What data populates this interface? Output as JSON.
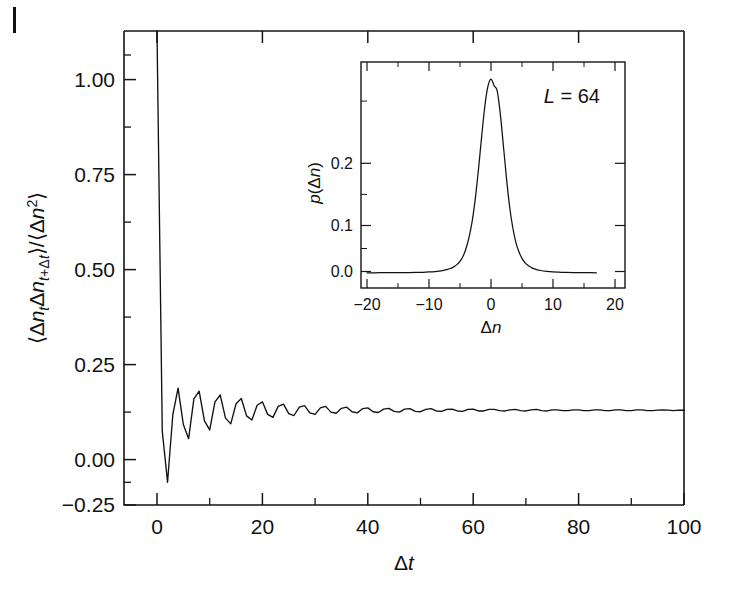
{
  "figure": {
    "page_mark": "|",
    "background_color": "#ffffff",
    "line_color": "#111111"
  },
  "chart_data": [
    {
      "id": "main",
      "type": "line",
      "title": "",
      "xlabel": "Δt",
      "ylabel": "⟨Δn_t Δn_{t+Δt}⟩ / ⟨Δn²⟩",
      "ylabel_parts": {
        "open1": "⟨",
        "delta_n1": "Δn",
        "sub1": "t",
        "delta_n2": "Δn",
        "sub2": "t+Δt",
        "close1": "⟩",
        "slash": "/",
        "open2": "⟨",
        "delta_n3": "Δn",
        "sup": "2",
        "close2": "⟩"
      },
      "xlim": [
        0,
        100
      ],
      "ylim": [
        -0.25,
        1.0
      ],
      "xticks": [
        0,
        20,
        40,
        60,
        80,
        100
      ],
      "xticklabels": [
        "0",
        "20",
        "40",
        "60",
        "80",
        "100"
      ],
      "yticks": [
        -0.25,
        0.0,
        0.25,
        0.5,
        0.75,
        1.0
      ],
      "yticklabels": [
        "−0.25",
        "0.00",
        "0.25",
        "0.50",
        "0.75",
        "1.00"
      ],
      "x_minor_ticks": [
        10,
        30,
        50,
        70,
        90
      ],
      "y_minor_ticks": [
        -0.125,
        0.125,
        0.375,
        0.625,
        0.875
      ],
      "grid": false,
      "legend": null,
      "description": "Normalized autocorrelation of particle-number fluctuations: damped oscillation decaying to zero.",
      "x": [
        0,
        1,
        2,
        3,
        4,
        5,
        6,
        7,
        8,
        9,
        10,
        11,
        12,
        13,
        14,
        15,
        16,
        17,
        18,
        19,
        20,
        21,
        22,
        23,
        24,
        25,
        26,
        27,
        28,
        29,
        30,
        31,
        32,
        33,
        34,
        35,
        36,
        37,
        38,
        39,
        40,
        41,
        42,
        43,
        44,
        45,
        46,
        47,
        48,
        49,
        50,
        51,
        52,
        53,
        54,
        55,
        56,
        57,
        58,
        59,
        60,
        61,
        62,
        63,
        64,
        65,
        66,
        67,
        68,
        69,
        70,
        71,
        72,
        73,
        74,
        75,
        76,
        77,
        78,
        79,
        80,
        81,
        82,
        83,
        84,
        85,
        86,
        87,
        88,
        89,
        90,
        91,
        92,
        93,
        94,
        95,
        96,
        97,
        98,
        99,
        100
      ],
      "y": [
        1.0,
        -0.055,
        -0.19,
        -0.012,
        0.058,
        -0.038,
        -0.075,
        0.03,
        0.05,
        -0.028,
        -0.052,
        0.022,
        0.04,
        -0.021,
        -0.036,
        0.017,
        0.031,
        -0.015,
        -0.026,
        0.013,
        0.022,
        -0.011,
        -0.019,
        0.01,
        0.016,
        -0.009,
        -0.014,
        0.008,
        0.012,
        -0.007,
        -0.011,
        0.006,
        0.01,
        -0.005,
        -0.008,
        0.005,
        0.008,
        -0.004,
        -0.007,
        0.004,
        0.006,
        -0.004,
        -0.006,
        0.003,
        0.005,
        -0.003,
        -0.005,
        0.003,
        0.004,
        -0.003,
        -0.004,
        0.002,
        0.004,
        -0.002,
        -0.003,
        0.002,
        0.003,
        -0.002,
        -0.003,
        0.002,
        0.003,
        -0.002,
        -0.002,
        0.002,
        0.002,
        -0.001,
        -0.002,
        0.001,
        0.002,
        -0.001,
        -0.002,
        0.001,
        0.002,
        -0.001,
        -0.002,
        0.001,
        0.001,
        -0.001,
        -0.001,
        0.001,
        0.001,
        -0.001,
        -0.001,
        0.001,
        0.001,
        -0.001,
        -0.001,
        0.001,
        0.001,
        -0.001,
        -0.001,
        0.001,
        0.001,
        -0.001,
        -0.001,
        0.0,
        0.001,
        0.0,
        -0.001,
        0.0,
        0.0
      ]
    },
    {
      "id": "inset",
      "type": "line",
      "title": "",
      "xlabel": "Δn",
      "ylabel": "p(Δn)",
      "xlim": [
        -20,
        20
      ],
      "ylim": [
        -0.02,
        0.285
      ],
      "xticks": [
        -20,
        -10,
        0,
        10,
        20
      ],
      "xticklabels": [
        "−20",
        "−10",
        "0",
        "10",
        "20"
      ],
      "yticks": [
        0.0,
        0.1,
        0.2
      ],
      "yticklabels": [
        "0.0",
        "0.1",
        "0.2"
      ],
      "x_minor_ticks": [
        -15,
        -5,
        5,
        15
      ],
      "y_minor_ticks": [
        0.05,
        0.15,
        0.25
      ],
      "grid": false,
      "annotation": {
        "text": "L = 64",
        "symbol": "L",
        "equals": "=",
        "value": "64"
      },
      "description": "Probability distribution p(Δn) of particle-number fluctuations for system size L = 64; sharply peaked at Δn = 0 with maximum ≈ 0.26.",
      "x": [
        -20,
        -18,
        -16,
        -14,
        -12,
        -11,
        -10,
        -9,
        -8,
        -7,
        -6.5,
        -6,
        -5.5,
        -5,
        -4.5,
        -4,
        -3.5,
        -3,
        -2.5,
        -2,
        -1.5,
        -1,
        -0.5,
        0,
        0.5,
        1,
        1.5,
        2,
        2.5,
        3,
        3.5,
        4,
        4.5,
        5,
        5.5,
        6,
        6.5,
        7,
        8,
        9,
        10,
        11,
        12,
        14,
        16,
        17
      ],
      "y": [
        0.0005,
        0.0006,
        0.0007,
        0.0008,
        0.001,
        0.0012,
        0.0016,
        0.0022,
        0.0032,
        0.005,
        0.0065,
        0.0085,
        0.0115,
        0.016,
        0.023,
        0.034,
        0.05,
        0.072,
        0.103,
        0.142,
        0.185,
        0.225,
        0.252,
        0.262,
        0.253,
        0.246,
        0.215,
        0.172,
        0.128,
        0.09,
        0.062,
        0.042,
        0.029,
        0.02,
        0.014,
        0.0102,
        0.0076,
        0.0058,
        0.0036,
        0.0024,
        0.0017,
        0.0013,
        0.001,
        0.0008,
        0.0006,
        0.0005
      ]
    }
  ],
  "main_axis": {
    "xlabel": "Δt",
    "yticklabels": [
      "1.00",
      "0.75",
      "0.50",
      "0.25",
      "0.00",
      "−0.25"
    ],
    "xticklabels": [
      "0",
      "20",
      "40",
      "60",
      "80",
      "100"
    ]
  },
  "inset_axis": {
    "xlabel": "Δn",
    "ylabel_p": "p",
    "ylabel_arg": "(Δn)",
    "yticklabels": [
      "0.2",
      "0.1",
      "0.0"
    ],
    "xticklabels": [
      "−20",
      "−10",
      "0",
      "10",
      "20"
    ],
    "annotation_symbol": "L",
    "annotation_rest": "= 64"
  }
}
